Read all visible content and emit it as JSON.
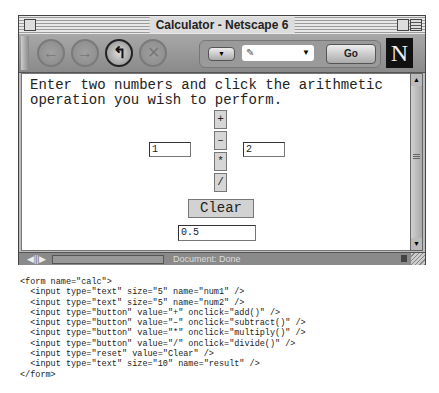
{
  "window": {
    "title": "Calculator - Netscape 6",
    "toolbar": {
      "back_icon": "←",
      "forward_icon": "→",
      "reload_icon": "↰",
      "stop_icon": "✕",
      "go_label": "Go",
      "logo": "N",
      "dropdown_icon": "▼",
      "url_value": ""
    },
    "status": {
      "text": "Document: Done"
    }
  },
  "page": {
    "instructions": "Enter two numbers and click the arithmetic\noperation you wish to perform.",
    "num1": "1",
    "num2": "2",
    "buttons": {
      "add": "+",
      "subtract": "–",
      "multiply": "*",
      "divide": "/",
      "clear": "Clear"
    },
    "result": "0.5"
  },
  "code_listing": "<form name=\"calc\">\n  <input type=\"text\" size=\"5\" name=\"num1\" />\n  <input type=\"text\" size=\"5\" name=\"num2\" />\n  <input type=\"button\" value=\"+\" onclick=\"add()\" />\n  <input type=\"button\" value=\"–\" onclick=\"subtract()\" />\n  <input type=\"button\" value=\"*\" onclick=\"multiply()\" />\n  <input type=\"button\" value=\"/\" onclick=\"divide()\" />\n  <input type=\"reset\" value=\"Clear\" />\n  <input type=\"text\" size=\"10\" name=\"result\" />\n</form>"
}
